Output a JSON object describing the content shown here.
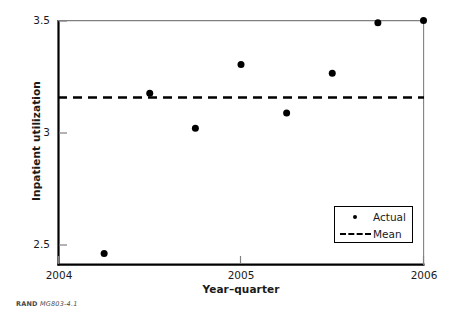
{
  "chart_data": {
    "type": "scatter",
    "title": "",
    "xlabel": "Year–quarter",
    "ylabel": "Inpatient utilization",
    "xlim": [
      2004,
      2006
    ],
    "ylim": [
      2.39,
      3.5
    ],
    "xticks": [
      "2004",
      "2005",
      "2006"
    ],
    "xtick_values": [
      2004,
      2005,
      2006
    ],
    "yticks": [
      "2.5",
      "3",
      "3.5"
    ],
    "ytick_values": [
      2.5,
      3,
      3.5
    ],
    "grid": false,
    "legend_position": "lower right",
    "series": [
      {
        "name": "Actual",
        "marker": "filled-circle",
        "color": "#000000",
        "x": [
          2004.25,
          2004.5,
          2004.75,
          2005.0,
          2005.25,
          2005.5,
          2005.75,
          2006.0
        ],
        "values": [
          2.44,
          3.17,
          3.01,
          3.3,
          3.08,
          3.26,
          3.49,
          3.5
        ]
      },
      {
        "name": "Mean",
        "style": "dashed-line",
        "color": "#000000",
        "x": [
          2004,
          2006
        ],
        "values": [
          3.15,
          3.15
        ]
      }
    ]
  },
  "legend": {
    "entries": [
      {
        "label": "Actual",
        "key": "dot"
      },
      {
        "label": "Mean",
        "key": "dash"
      }
    ]
  },
  "axes": {
    "y_title": "Inpatient utilization",
    "x_title": "Year–quarter",
    "y_tick_labels": [
      "3.5",
      "3",
      "2.5"
    ],
    "x_tick_labels": [
      "2004",
      "2005",
      "2006"
    ]
  },
  "credit": {
    "brand": "RAND",
    "document_id": "MG803-4.1"
  },
  "colors": {
    "axis": "#000000",
    "marker": "#000000",
    "mean_line": "#000000",
    "background": "#ffffff"
  }
}
